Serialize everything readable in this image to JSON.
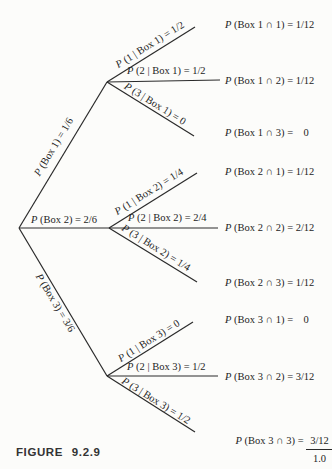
{
  "figure_caption": "FIGURE 9.2.9",
  "colors": {
    "ink": "#2a2a2a",
    "background": "#fcfcfa"
  },
  "tree": {
    "level1": [
      {
        "p": "P",
        "rest": " (Box 1) = 1/6"
      },
      {
        "p": "P",
        "rest": " (Box 2) = 2/6"
      },
      {
        "p": "P",
        "rest": " (Box 3) = 3/6"
      }
    ],
    "level2": [
      {
        "p": "P",
        "rest": " (1 | Box 1) = 1/2"
      },
      {
        "p": "P",
        "rest": " (2 | Box 1) = 1/2"
      },
      {
        "p": "P",
        "rest": " (3 | Box 1) = 0"
      },
      {
        "p": "P",
        "rest": " (1 | Box 2) = 1/4"
      },
      {
        "p": "P",
        "rest": " (2 | Box 2) = 2/4"
      },
      {
        "p": "P",
        "rest": " (3 | Box 2) = 1/4"
      },
      {
        "p": "P",
        "rest": " (1 | Box 3) = 0"
      },
      {
        "p": "P",
        "rest": " (2 | Box 3) = 1/2"
      },
      {
        "p": "P",
        "rest": " (3 | Box 3) = 1/2"
      }
    ]
  },
  "outcomes": [
    {
      "p": "P",
      "rest": " (Box 1 ∩ 1) = 1/12"
    },
    {
      "p": "P",
      "rest": " (Box 1 ∩ 2) = 1/12"
    },
    {
      "p": "P",
      "rest": " (Box 1 ∩ 3) =    0"
    },
    {
      "p": "P",
      "rest": " (Box 2 ∩ 1) = 1/12"
    },
    {
      "p": "P",
      "rest": " (Box 2 ∩ 2) = 2/12"
    },
    {
      "p": "P",
      "rest": " (Box 2 ∩ 3) = 1/12"
    },
    {
      "p": "P",
      "rest": " (Box 3 ∩ 1) =    0"
    },
    {
      "p": "P",
      "rest": " (Box 3 ∩ 2) = 3/12"
    },
    {
      "p": "P",
      "rest": " (Box 3 ∩ 3) = ",
      "numerator": "3/12",
      "total": "1.0"
    }
  ]
}
